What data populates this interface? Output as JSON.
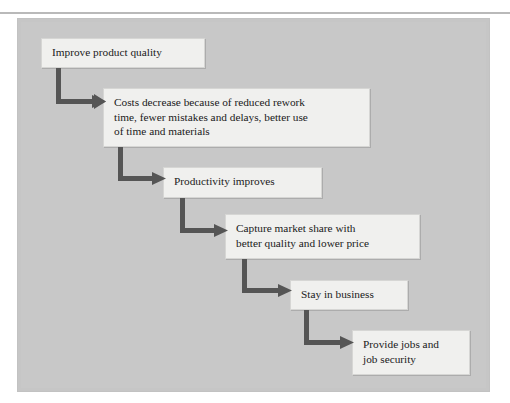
{
  "figure": {
    "kind": "flowchart",
    "title": "",
    "orientation": "cascading-top-left-to-bottom-right",
    "colors": {
      "panel_background": "#c6c6c6",
      "box_fill": "#f0f0ee",
      "box_border": "#d6d6d4",
      "arrow": "#555555",
      "text": "#1a1a1a",
      "top_rule": "#b9b9b9"
    },
    "nodes": [
      {
        "id": "node-1",
        "name": "improve-product-quality",
        "text": "Improve product quality",
        "x": 41,
        "y": 38,
        "w": 164,
        "h": 30
      },
      {
        "id": "node-2",
        "name": "costs-decrease",
        "text": "Costs decrease because of reduced rework\ntime, fewer mistakes and delays, better use\nof time and materials",
        "x": 103,
        "y": 88,
        "w": 267,
        "h": 59
      },
      {
        "id": "node-3",
        "name": "productivity-improves",
        "text": "Productivity improves",
        "x": 163,
        "y": 167,
        "w": 159,
        "h": 31
      },
      {
        "id": "node-4",
        "name": "capture-market-share",
        "text": "Capture market share with\nbetter quality and lower price",
        "x": 225,
        "y": 214,
        "w": 195,
        "h": 45
      },
      {
        "id": "node-5",
        "name": "stay-in-business",
        "text": "Stay in business",
        "x": 290,
        "y": 280,
        "w": 118,
        "h": 30
      },
      {
        "id": "node-6",
        "name": "provide-jobs-and-job-security",
        "text": "Provide jobs and\njob security",
        "x": 352,
        "y": 330,
        "w": 118,
        "h": 45
      }
    ],
    "edges": [
      {
        "id": "edge-1",
        "name": "arrow-quality-to-costs",
        "from": "node-1",
        "to": "node-2",
        "x": 56,
        "y": 68,
        "w": 50,
        "h": 40,
        "shape": "elbow-down-right"
      },
      {
        "id": "edge-2",
        "name": "arrow-costs-to-productivity",
        "from": "node-2",
        "to": "node-3",
        "x": 118,
        "y": 147,
        "w": 48,
        "h": 38,
        "shape": "elbow-down-right"
      },
      {
        "id": "edge-3",
        "name": "arrow-productivity-to-market",
        "from": "node-3",
        "to": "node-4",
        "x": 180,
        "y": 198,
        "w": 48,
        "h": 40,
        "shape": "elbow-down-right"
      },
      {
        "id": "edge-4",
        "name": "arrow-market-to-business",
        "from": "node-4",
        "to": "node-5",
        "x": 242,
        "y": 259,
        "w": 50,
        "h": 38,
        "shape": "elbow-down-right"
      },
      {
        "id": "edge-5",
        "name": "arrow-business-to-jobs",
        "from": "node-5",
        "to": "node-6",
        "x": 304,
        "y": 310,
        "w": 50,
        "h": 40,
        "shape": "elbow-down-right"
      }
    ]
  }
}
